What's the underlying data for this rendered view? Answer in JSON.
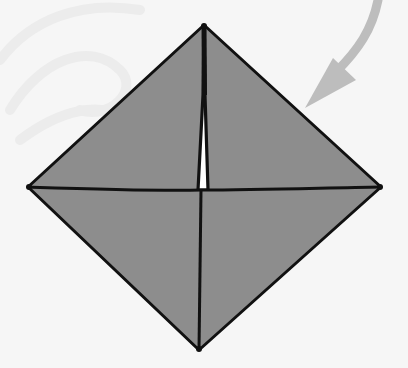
{
  "diagram": {
    "type": "origami-fold-step",
    "colors": {
      "background": "#f6f6f6",
      "paper_fill": "#8d8d8d",
      "outline": "#111111",
      "arrow": "#bdbdbd",
      "slit": "#ffffff",
      "watermark": "#ececec"
    },
    "shape": {
      "top": [
        204,
        25
      ],
      "right": [
        381,
        187
      ],
      "bottom": [
        199,
        350
      ],
      "left": [
        28,
        187
      ],
      "center": [
        201,
        190
      ]
    },
    "arrow": {
      "meaning": "fold-direction-arrow",
      "start": [
        380,
        0
      ],
      "end": [
        305,
        108
      ]
    }
  }
}
